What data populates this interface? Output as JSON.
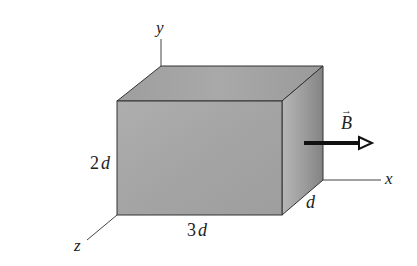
{
  "diagram": {
    "axes": {
      "x_label": "x",
      "y_label": "y",
      "z_label": "z"
    },
    "dimensions": {
      "height_coef": "2",
      "height_unit": "d",
      "width_coef": "3",
      "width_unit": "d",
      "depth_label": "d"
    },
    "field": {
      "symbol": "B",
      "vector_mark": "→",
      "direction": "+x"
    },
    "colors": {
      "front_face": "#a8a8a8",
      "top_face": "#a3a3a3",
      "side_face_light": "#b4b4b4",
      "side_face_dark": "#858585",
      "edge": "#333333",
      "arrow": "#111111",
      "background": "#ffffff"
    }
  }
}
